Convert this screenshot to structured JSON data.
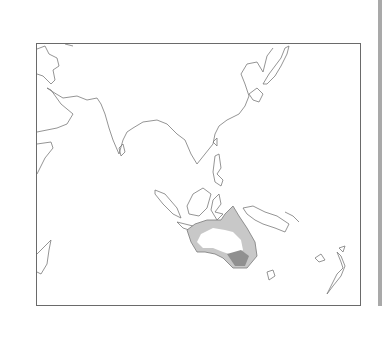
{
  "map": {
    "title": "",
    "region": "Indo-Pacific / Australasia",
    "frame_color": "#6a6a6a",
    "coast_color": "#777777",
    "shade_colors": {
      "light": "#c8c8c8",
      "medium": "#a0a0a0",
      "dark": "#808080"
    },
    "landmasses": [
      "Arabian Peninsula",
      "Horn of Africa",
      "Madagascar",
      "India",
      "Sri Lanka",
      "Southeast Asia",
      "China coast",
      "Korea",
      "Japan",
      "Taiwan",
      "Philippines",
      "Sumatra",
      "Borneo",
      "Sulawesi",
      "Java",
      "New Guinea",
      "Solomon Islands",
      "Australia",
      "Tasmania",
      "New Caledonia",
      "Fiji",
      "New Zealand"
    ]
  },
  "sidebar": {
    "color": "#a9a9a9"
  }
}
